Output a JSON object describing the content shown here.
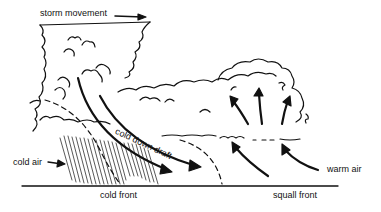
{
  "diagram": {
    "type": "squall line / thunderstorm cross-section",
    "labels": {
      "storm_movement": "storm movement",
      "cold_down_draft": "cold down draft",
      "cold_air": "cold air",
      "warm_air": "warm air",
      "cold_front": "cold front",
      "squall_front": "squall front"
    },
    "colors": {
      "ink": "#111111",
      "background": "#ffffff"
    }
  }
}
